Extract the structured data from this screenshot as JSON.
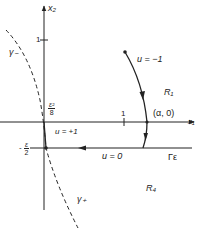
{
  "diagram": {
    "axes": {
      "x_label": "x₁",
      "y_label": "x₂",
      "x_tick": "1",
      "y_tick": "1"
    },
    "points": {
      "alpha_point": "(α, 0)",
      "eps2_over_8": {
        "num": "ε²",
        "den": "8"
      },
      "neg_eps_over_2": {
        "sign": "-",
        "num": "ε",
        "den": "2"
      }
    },
    "curves": {
      "gamma_minus": "γ₋",
      "gamma_plus": "γ₊",
      "u_minus_one": "u = −1",
      "u_plus_one": "u = +1",
      "u_zero": "u = 0",
      "Gamma_eps": "Γε"
    },
    "regions": {
      "R1": "R₁",
      "R4": "R₄"
    },
    "colors": {
      "ink": "#222222",
      "background": "#ffffff"
    }
  }
}
